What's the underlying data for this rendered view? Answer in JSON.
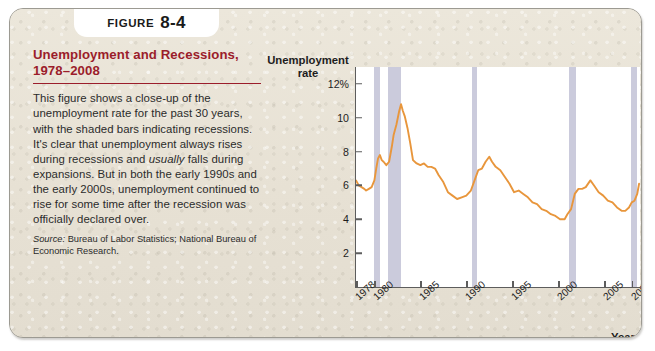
{
  "figure": {
    "tab_word": "FIGURE",
    "tab_number": "8-4",
    "title": "Unemployment and Recessions, 1978–2008",
    "body": "This figure shows a close-up of the unemployment rate for the past 30 years, with the shaded bars indicating recessions. It's clear that unemployment always rises during recessions and usually falls during expansions. But in both the early 1990s and the early 2000s, unemployment continued to rise for some time after the recession was officially declared over.",
    "source_label": "Source:",
    "source_text": " Bureau of Labor Statistics; National Bureau of Economic Research.",
    "title_color": "#9b1d2b"
  },
  "chart_data": {
    "type": "line",
    "title": "Unemployment and Recessions, 1978–2008",
    "xlabel": "Year",
    "ylabel": "Unemployment rate",
    "ylabel_line1": "Unemployment",
    "ylabel_line2": "rate",
    "xlim": [
      1978,
      2008.9
    ],
    "ylim": [
      0,
      13
    ],
    "grid": false,
    "legend": "none",
    "line_color": "#e8963c",
    "recession_band_color": "#c2c2d6",
    "ytick_labels": [
      "12%",
      "10",
      "8",
      "6",
      "4",
      "2"
    ],
    "ytick_values": [
      12,
      10,
      8,
      6,
      4,
      2
    ],
    "xtick_labels": [
      "1978",
      "1980",
      "1985",
      "1990",
      "1995",
      "2000",
      "2005",
      "2008"
    ],
    "xtick_values": [
      1978,
      1980,
      1985,
      1990,
      1995,
      2000,
      2005,
      2008
    ],
    "recessions": [
      {
        "start": 1980.0,
        "end": 1980.6
      },
      {
        "start": 1981.5,
        "end": 1982.9
      },
      {
        "start": 1990.6,
        "end": 1991.2
      },
      {
        "start": 2001.2,
        "end": 2001.9
      },
      {
        "start": 2007.95,
        "end": 2008.6
      }
    ],
    "series": [
      {
        "name": "Unemployment rate",
        "x": [
          1978.0,
          1978.3,
          1978.6,
          1978.9,
          1979.1,
          1979.4,
          1979.7,
          1980.0,
          1980.2,
          1980.4,
          1980.6,
          1980.8,
          1981.0,
          1981.3,
          1981.6,
          1981.9,
          1982.1,
          1982.4,
          1982.7,
          1982.9,
          1983.1,
          1983.3,
          1983.6,
          1983.9,
          1984.2,
          1984.6,
          1985.0,
          1985.4,
          1985.8,
          1986.2,
          1986.6,
          1987.0,
          1987.5,
          1988.0,
          1988.5,
          1989.0,
          1989.5,
          1990.0,
          1990.5,
          1990.9,
          1991.3,
          1991.7,
          1992.1,
          1992.5,
          1992.8,
          1993.2,
          1993.7,
          1994.2,
          1994.7,
          1995.2,
          1995.7,
          1996.2,
          1996.7,
          1997.2,
          1997.7,
          1998.2,
          1998.7,
          1999.2,
          1999.7,
          2000.2,
          2000.7,
          2001.0,
          2001.4,
          2001.8,
          2002.2,
          2002.6,
          2003.0,
          2003.5,
          2003.9,
          2004.4,
          2004.9,
          2005.4,
          2005.9,
          2006.4,
          2006.9,
          2007.3,
          2007.7,
          2008.0,
          2008.3,
          2008.6,
          2008.8
        ],
        "y": [
          6.3,
          6.0,
          5.9,
          5.8,
          5.7,
          5.8,
          5.9,
          6.3,
          7.0,
          7.6,
          7.8,
          7.5,
          7.4,
          7.2,
          7.4,
          8.3,
          9.0,
          9.6,
          10.4,
          10.8,
          10.4,
          10.1,
          9.4,
          8.5,
          7.5,
          7.3,
          7.2,
          7.3,
          7.1,
          7.1,
          7.0,
          6.6,
          6.2,
          5.6,
          5.4,
          5.2,
          5.3,
          5.4,
          5.7,
          6.3,
          6.9,
          7.0,
          7.4,
          7.7,
          7.4,
          7.1,
          6.9,
          6.5,
          6.1,
          5.6,
          5.7,
          5.5,
          5.3,
          5.0,
          4.9,
          4.6,
          4.5,
          4.3,
          4.2,
          4.0,
          4.0,
          4.3,
          4.6,
          5.5,
          5.8,
          5.8,
          5.9,
          6.3,
          6.0,
          5.6,
          5.4,
          5.1,
          5.0,
          4.7,
          4.5,
          4.5,
          4.7,
          5.0,
          5.1,
          5.5,
          6.1
        ]
      }
    ]
  }
}
